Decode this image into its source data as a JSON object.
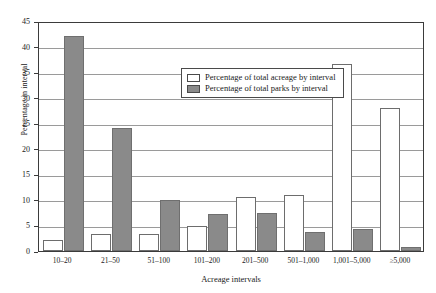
{
  "chart_data": {
    "type": "bar",
    "title": "",
    "xlabel": "Acreage intervals",
    "ylabel": "Percentage in interval",
    "ylim": [
      0,
      45
    ],
    "ytick_step": 5,
    "yticks": [
      "0",
      "5",
      "10",
      "15",
      "20",
      "25",
      "30",
      "35",
      "40",
      "45"
    ],
    "grid": true,
    "legend_position": "top-center",
    "categories": [
      "10–20",
      "21–50",
      "51–100",
      "101–200",
      "201–500",
      "501–1,000",
      "1,001–5,000",
      "≥5,000"
    ],
    "series": [
      {
        "name": "Percentage of total acreage by interval",
        "color": "#ffffff",
        "values": [
          2.2,
          3.3,
          3.3,
          4.8,
          10.5,
          11.0,
          36.5,
          28.0
        ]
      },
      {
        "name": "Percentage of total parks by interval",
        "color": "#8a8a8a",
        "values": [
          42.0,
          24.0,
          10.0,
          7.3,
          7.5,
          3.7,
          4.3,
          0.7
        ]
      }
    ]
  },
  "legend": {
    "items": [
      {
        "label": "Percentage of total acreage by interval",
        "swatch": "white-swatch"
      },
      {
        "label": "Percentage of total parks by interval",
        "swatch": "gray-swatch"
      }
    ]
  },
  "axes": {
    "y_title": "Percentage in interval",
    "x_title": "Acreage intervals"
  }
}
